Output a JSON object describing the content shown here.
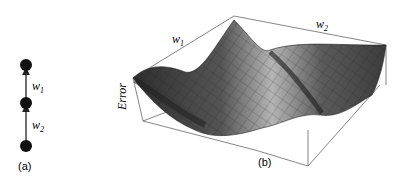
{
  "panel_a": {
    "caption": "(a)",
    "nodes": 3,
    "edge_labels": {
      "upper": "w",
      "upper_sub": "1",
      "lower": "w",
      "lower_sub": "2"
    }
  },
  "panel_b": {
    "caption": "(b)",
    "axis_labels": {
      "w1": "w",
      "w1_sub": "1",
      "w2": "w",
      "w2_sub": "2",
      "z": "Error"
    },
    "surface": "3D error surface over weights w1 and w2 with a curved valley"
  },
  "colors": {
    "node": "#111111",
    "edge": "#222222",
    "box": "#666666",
    "surface_dark": "#3a3a3a",
    "surface_light": "#b8b8b8"
  }
}
